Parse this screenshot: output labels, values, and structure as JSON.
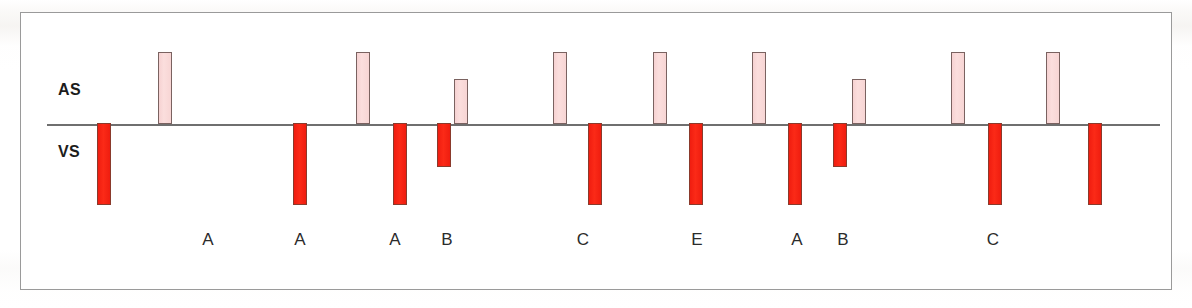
{
  "figure": {
    "kind": "pacemaker-marker-channel-strip",
    "row_labels": {
      "atrial": "AS",
      "ventricular": "VS"
    },
    "colors": {
      "atrial_sense_fill": "#f8dbda",
      "ventricular_sense_fill": "#f42113",
      "marker_outline": "#6b5a57",
      "baseline": "#6f6f6f",
      "frame_border": "#9a9a9a",
      "text": "#1c1c1c",
      "background": "#ffffff"
    }
  },
  "chart_data": {
    "type": "bar",
    "title": "",
    "subtitle": "",
    "xlabel": "",
    "ylabel": "",
    "grid": false,
    "legend": null,
    "orientation": "vertical-diverging",
    "baseline_y_px": 124,
    "axis_note": "Marker channel: upward deflections = atrial sensed events (AS), downward deflections = ventricular sensed events (VS). Amplitudes are marker heights, not voltages.",
    "series": [
      {
        "name": "AS",
        "direction": "up",
        "values": [
          0,
          72,
          72,
          72,
          45,
          72,
          72,
          72,
          45,
          72,
          72
        ],
        "x_px": [
          97,
          158,
          356,
          454,
          415,
          553,
          653,
          752,
          852,
          951,
          1046
        ]
      },
      {
        "name": "VS",
        "direction": "down",
        "values": [
          82,
          0,
          82,
          82,
          44,
          82,
          82,
          82,
          44,
          82,
          82
        ],
        "x_px": [
          97,
          0,
          293,
          393,
          437,
          588,
          689,
          788,
          833,
          988,
          1088
        ]
      }
    ],
    "markers": [
      {
        "index": 0,
        "type": "VS",
        "x_px": 97,
        "width_px": 14,
        "height_px": 82,
        "label": ""
      },
      {
        "index": 1,
        "type": "AS",
        "x_px": 158,
        "width_px": 14,
        "height_px": 72,
        "label": ""
      },
      {
        "index": 2,
        "type": "VS",
        "x_px": 293,
        "width_px": 14,
        "height_px": 82,
        "label": ""
      },
      {
        "index": 3,
        "type": "AS",
        "x_px": 356,
        "width_px": 14,
        "height_px": 72,
        "label": "A"
      },
      {
        "index": 4,
        "type": "VS",
        "x_px": 393,
        "width_px": 14,
        "height_px": 82,
        "label": ""
      },
      {
        "index": 5,
        "type": "VS",
        "x_px": 437,
        "width_px": 14,
        "height_px": 44,
        "label": ""
      },
      {
        "index": 6,
        "type": "AS",
        "x_px": 454,
        "width_px": 14,
        "height_px": 45,
        "label": "B"
      },
      {
        "index": 7,
        "type": "AS",
        "x_px": 553,
        "width_px": 14,
        "height_px": 72,
        "label": ""
      },
      {
        "index": 8,
        "type": "VS",
        "x_px": 588,
        "width_px": 14,
        "height_px": 82,
        "label": "C"
      },
      {
        "index": 9,
        "type": "AS",
        "x_px": 653,
        "width_px": 14,
        "height_px": 72,
        "label": ""
      },
      {
        "index": 10,
        "type": "VS",
        "x_px": 689,
        "width_px": 14,
        "height_px": 82,
        "label": "E"
      },
      {
        "index": 11,
        "type": "AS",
        "x_px": 752,
        "width_px": 14,
        "height_px": 72,
        "label": ""
      },
      {
        "index": 12,
        "type": "VS",
        "x_px": 788,
        "width_px": 14,
        "height_px": 82,
        "label": "A"
      },
      {
        "index": 13,
        "type": "VS",
        "x_px": 833,
        "width_px": 14,
        "height_px": 44,
        "label": ""
      },
      {
        "index": 14,
        "type": "AS",
        "x_px": 852,
        "width_px": 14,
        "height_px": 45,
        "label": "B"
      },
      {
        "index": 15,
        "type": "AS",
        "x_px": 951,
        "width_px": 14,
        "height_px": 72,
        "label": ""
      },
      {
        "index": 16,
        "type": "VS",
        "x_px": 988,
        "width_px": 14,
        "height_px": 82,
        "label": "C"
      },
      {
        "index": 17,
        "type": "AS",
        "x_px": 1046,
        "width_px": 14,
        "height_px": 72,
        "label": ""
      },
      {
        "index": 18,
        "type": "VS",
        "x_px": 1088,
        "width_px": 14,
        "height_px": 82,
        "label": ""
      }
    ],
    "event_labels": [
      {
        "text": "A",
        "x_px": 208
      },
      {
        "text": "A",
        "x_px": 300
      },
      {
        "text": "A",
        "x_px": 395
      },
      {
        "text": "B",
        "x_px": 447
      },
      {
        "text": "C",
        "x_px": 583
      },
      {
        "text": "E",
        "x_px": 697
      },
      {
        "text": "A",
        "x_px": 797
      },
      {
        "text": "B",
        "x_px": 843
      },
      {
        "text": "C",
        "x_px": 993
      }
    ]
  }
}
